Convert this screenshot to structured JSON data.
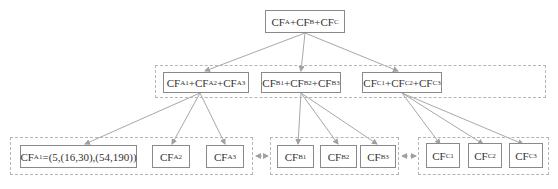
{
  "root": {
    "label": "CF",
    "subs": [
      "A",
      "B",
      "C"
    ],
    "text": "CF_A+CF_B+CF_C"
  },
  "level1": [
    {
      "id": "A",
      "parts": [
        "A1",
        "A2",
        "A3"
      ],
      "text": "CF_A1+CF_A2+CF_A3"
    },
    {
      "id": "B",
      "parts": [
        "B1",
        "B2",
        "B3"
      ],
      "text": "CF_B1+CF_B2+CF_B3"
    },
    {
      "id": "C",
      "parts": [
        "C1",
        "C2",
        "C3"
      ],
      "text": "CF_C1+CF_C2+CF_C3"
    }
  ],
  "leaves": {
    "A1": {
      "sub": "A1",
      "value": "=(5,(16,30),(54,190))"
    },
    "A2": {
      "sub": "A2"
    },
    "A3": {
      "sub": "A3"
    },
    "B1": {
      "sub": "B1"
    },
    "B2": {
      "sub": "B2"
    },
    "B3": {
      "sub": "B3"
    },
    "C1": {
      "sub": "C1"
    },
    "C2": {
      "sub": "C2"
    },
    "C3": {
      "sub": "C3"
    }
  },
  "prefix": "CF",
  "plus": "+",
  "colors": {
    "border": "#8a8a8a",
    "dashed": "#b5b5b5",
    "edge": "#a0a0a0"
  }
}
